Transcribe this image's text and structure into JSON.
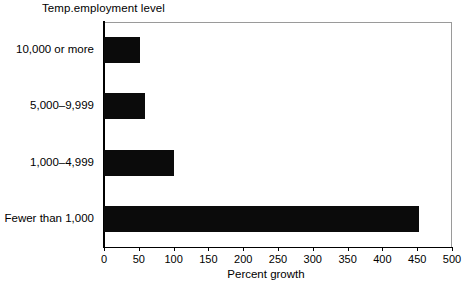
{
  "chart_data": {
    "type": "bar",
    "orientation": "horizontal",
    "title": "Temp.employment level",
    "xlabel": "Percent growth",
    "ylabel": "",
    "categories": [
      "10,000 or more",
      "5,000–9,999",
      "1,000–4,999",
      "Fewer than 1,000"
    ],
    "values": [
      52,
      59,
      100,
      452
    ],
    "xlim": [
      0,
      500
    ],
    "xticks": [
      0,
      50,
      100,
      150,
      200,
      250,
      300,
      350,
      400,
      450,
      500
    ],
    "xtick_labels": [
      "0",
      "50",
      "100",
      "150",
      "200",
      "250",
      "300",
      "350",
      "400",
      "450",
      "500"
    ],
    "grid": false,
    "legend": null,
    "bar_color": "#0b0b0b",
    "frame_color": "#9a9a9a",
    "axis_color": "#000000",
    "background": "#ffffff"
  }
}
